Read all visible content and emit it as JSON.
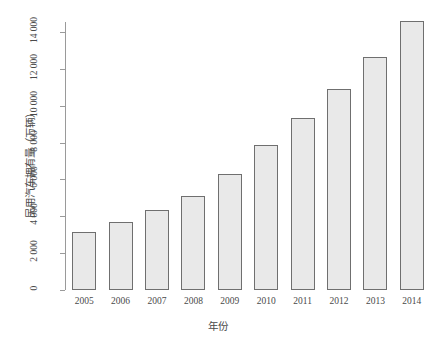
{
  "chart_data": {
    "type": "bar",
    "title": "",
    "xlabel": "年份",
    "ylabel": "民用汽车拥有量（万辆）",
    "categories": [
      "2005",
      "2006",
      "2007",
      "2008",
      "2009",
      "2010",
      "2011",
      "2012",
      "2013",
      "2014"
    ],
    "values": [
      3160,
      3700,
      4360,
      5100,
      6280,
      7870,
      9350,
      10930,
      12670,
      14600
    ],
    "ylim": [
      0,
      15200
    ],
    "yticks": [
      0,
      2000,
      4000,
      6000,
      8000,
      10000,
      12000,
      14000
    ],
    "ytick_labels": [
      "0",
      "2 000",
      "4 000",
      "6 000",
      "8 000",
      "10 000",
      "12 000",
      "14 000"
    ],
    "grid": false,
    "legend": null,
    "series": [
      {
        "name": "民用汽车拥有量",
        "values": [
          3160,
          3700,
          4360,
          5100,
          6280,
          7870,
          9350,
          10930,
          12670,
          14600
        ]
      }
    ],
    "bar_fill_color": "#e9e9e9",
    "bar_border_color": "#6f6f6f",
    "axis_color": "#9a9a9a",
    "text_color": "#4a4a4a"
  },
  "caption": ""
}
